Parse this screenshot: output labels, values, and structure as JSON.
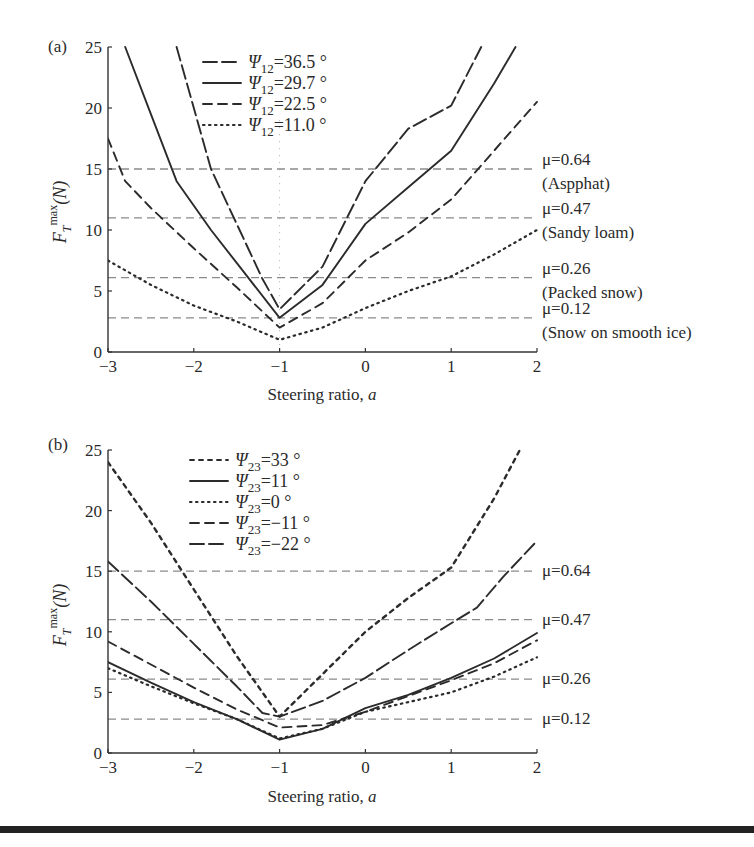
{
  "chart_data": [
    {
      "panel_label": "(a)",
      "type": "line",
      "title": "",
      "xlabel": "Steering ratio, a",
      "ylabel": "F_T^max (N)",
      "xlim": [
        -3,
        2
      ],
      "ylim": [
        0,
        25
      ],
      "xticks": [
        -3,
        -2,
        -1,
        0,
        1,
        2
      ],
      "yticks": [
        0,
        5,
        10,
        15,
        20,
        25
      ],
      "grid": false,
      "legend_position": "upper center",
      "legend_param": "Ψ12",
      "series": [
        {
          "name": "Ψ12=36.5 °",
          "style": "longdash",
          "x": [
            -2.2,
            -1.8,
            -1.5,
            -1.2,
            -1.0,
            -0.5,
            0.0,
            0.5,
            1.0,
            1.35
          ],
          "y": [
            25,
            15.0,
            10.5,
            6.0,
            3.5,
            7.0,
            14.0,
            18.3,
            20.2,
            25
          ]
        },
        {
          "name": "Ψ12=29.7 °",
          "style": "solid",
          "x": [
            -2.8,
            -2.5,
            -2.2,
            -1.8,
            -1.5,
            -1.0,
            -0.5,
            0.0,
            0.5,
            1.0,
            1.5,
            1.75
          ],
          "y": [
            25,
            19.5,
            14.0,
            10.0,
            7.3,
            2.8,
            5.5,
            10.5,
            13.5,
            16.5,
            22.0,
            25
          ]
        },
        {
          "name": "Ψ12=22.5 °",
          "style": "dash",
          "x": [
            -3.0,
            -2.8,
            -2.5,
            -2.0,
            -1.5,
            -1.0,
            -0.5,
            0.0,
            0.5,
            1.0,
            1.5,
            2.0
          ],
          "y": [
            17.5,
            14.0,
            11.8,
            8.5,
            5.3,
            2.0,
            4.0,
            7.5,
            9.8,
            12.5,
            16.5,
            20.5
          ]
        },
        {
          "name": "Ψ12=11.0 °",
          "style": "dot",
          "x": [
            -3.0,
            -2.5,
            -2.0,
            -1.5,
            -1.0,
            -0.5,
            0.0,
            0.5,
            1.0,
            1.5,
            2.0
          ],
          "y": [
            7.5,
            5.5,
            3.8,
            2.5,
            1.0,
            2.0,
            3.6,
            5.0,
            6.2,
            8.0,
            10.0
          ]
        }
      ],
      "reference_lines": [
        {
          "y": 15.0,
          "mu": "μ=0.64",
          "surface": "(Aspphat)"
        },
        {
          "y": 11.0,
          "mu": "μ=0.47",
          "surface": "(Sandy loam)"
        },
        {
          "y": 6.1,
          "mu": "μ=0.26",
          "surface": "(Packed snow)"
        },
        {
          "y": 2.8,
          "mu": "μ=0.12",
          "surface": "(Snow on smooth ice)"
        }
      ],
      "annotations": [
        "vertical dotted line at a = -1"
      ]
    },
    {
      "panel_label": "(b)",
      "type": "line",
      "title": "",
      "xlabel": "Steering ratio, a",
      "ylabel": "F_T^max (N)",
      "xlim": [
        -3,
        2
      ],
      "ylim": [
        0,
        25
      ],
      "xticks": [
        -3,
        -2,
        -1,
        0,
        1,
        2
      ],
      "yticks": [
        0,
        5,
        10,
        15,
        20,
        25
      ],
      "grid": false,
      "legend_position": "upper center",
      "legend_param": "Ψ23",
      "series": [
        {
          "name": "Ψ23=33 °",
          "style": "shortdash",
          "x": [
            -3.0,
            -2.5,
            -2.0,
            -1.5,
            -1.0,
            -0.5,
            0.0,
            0.5,
            1.0,
            1.5,
            1.8
          ],
          "y": [
            24.0,
            19.0,
            13.5,
            8.0,
            3.0,
            6.5,
            10.0,
            12.8,
            15.3,
            21.0,
            25
          ]
        },
        {
          "name": "Ψ23=11 °",
          "style": "solid",
          "x": [
            -3.0,
            -2.5,
            -2.0,
            -1.5,
            -1.0,
            -0.5,
            0.0,
            0.5,
            1.0,
            1.5,
            2.0
          ],
          "y": [
            7.5,
            5.8,
            4.2,
            2.8,
            1.1,
            2.0,
            3.7,
            4.8,
            6.2,
            7.8,
            9.9
          ]
        },
        {
          "name": "Ψ23=0 °",
          "style": "dot",
          "x": [
            -3.0,
            -2.5,
            -2.0,
            -1.5,
            -1.0,
            -0.5,
            0.0,
            0.5,
            1.0,
            1.5,
            2.0
          ],
          "y": [
            7.0,
            5.5,
            4.1,
            2.8,
            1.2,
            2.0,
            3.4,
            4.2,
            5.0,
            6.3,
            7.9
          ]
        },
        {
          "name": "Ψ23=-11 °",
          "style": "dash",
          "x": [
            -3.0,
            -2.5,
            -2.0,
            -1.5,
            -1.0,
            -0.5,
            0.0,
            0.5,
            1.0,
            1.5,
            2.0
          ],
          "y": [
            9.2,
            7.3,
            5.4,
            3.6,
            2.1,
            2.3,
            3.4,
            4.7,
            6.0,
            7.4,
            9.3
          ]
        },
        {
          "name": "Ψ23=-22 °",
          "style": "longdash",
          "x": [
            -3.0,
            -2.5,
            -2.0,
            -1.5,
            -1.2,
            -1.0,
            -0.5,
            0.0,
            0.5,
            1.0,
            1.3,
            1.6,
            2.0
          ],
          "y": [
            15.8,
            12.5,
            9.0,
            5.5,
            3.3,
            3.0,
            4.3,
            6.2,
            8.5,
            10.7,
            12.0,
            14.5,
            17.5
          ]
        }
      ],
      "reference_lines": [
        {
          "y": 15.0,
          "mu": "μ=0.64"
        },
        {
          "y": 11.0,
          "mu": "μ=0.47"
        },
        {
          "y": 6.1,
          "mu": "μ=0.26"
        },
        {
          "y": 2.8,
          "mu": "μ=0.12"
        }
      ]
    }
  ],
  "panels": {
    "a": {
      "label": "(a)",
      "xlabel": "Steering ratio,",
      "xlabel_var": "a",
      "ylabel_main": "F",
      "ylabel_sub": "T",
      "ylabel_sup": "max",
      "ylabel_unit": "(N)"
    },
    "b": {
      "label": "(b)",
      "xlabel": "Steering ratio,",
      "xlabel_var": "a",
      "ylabel_main": "F",
      "ylabel_sub": "T",
      "ylabel_sup": "max",
      "ylabel_unit": "(N)"
    }
  },
  "colors": {
    "curve": "#2b2b2b",
    "reference": "#8a8a8a",
    "axis": "#333333"
  }
}
